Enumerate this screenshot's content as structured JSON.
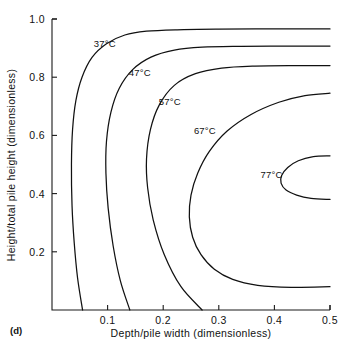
{
  "figure": {
    "panel_label": "(d)",
    "background_color": "#ffffff",
    "line_color": "#111111"
  },
  "chart_data": {
    "type": "line",
    "subtype": "contour",
    "title": "",
    "xlabel": "Depth/pile width (dimensionless)",
    "ylabel": "Height/total pile height (dimensionless)",
    "xlim": [
      0.0,
      0.5
    ],
    "ylim": [
      0.0,
      1.0
    ],
    "xticks": [
      0.1,
      0.2,
      0.3,
      0.4,
      0.5
    ],
    "yticks": [
      0.2,
      0.4,
      0.6,
      0.8,
      1.0
    ],
    "xticklabels": [
      "0.1",
      "0.2",
      "0.3",
      "0.4",
      "0.5"
    ],
    "yticklabels": [
      "0.2",
      "0.4",
      "0.6",
      "0.8",
      "1.0"
    ],
    "grid": false,
    "legend": "none",
    "contour_labels_inline": true,
    "levels": [
      {
        "label": "37°C",
        "value": 37,
        "unit": "°C",
        "label_position": [
          0.095,
          0.905
        ],
        "points": [
          [
            0.055,
            0.0
          ],
          [
            0.046,
            0.11
          ],
          [
            0.04,
            0.23
          ],
          [
            0.036,
            0.36
          ],
          [
            0.035,
            0.5
          ],
          [
            0.037,
            0.62
          ],
          [
            0.043,
            0.72
          ],
          [
            0.054,
            0.8
          ],
          [
            0.072,
            0.868
          ],
          [
            0.098,
            0.915
          ],
          [
            0.131,
            0.945
          ],
          [
            0.17,
            0.958
          ],
          [
            0.225,
            0.963
          ],
          [
            0.3,
            0.965
          ],
          [
            0.4,
            0.966
          ],
          [
            0.5,
            0.966
          ]
        ]
      },
      {
        "label": "47°C",
        "value": 47,
        "unit": "°C",
        "label_position": [
          0.158,
          0.805
        ],
        "points": [
          [
            0.14,
            0.0
          ],
          [
            0.123,
            0.1
          ],
          [
            0.11,
            0.22
          ],
          [
            0.101,
            0.35
          ],
          [
            0.097,
            0.47
          ],
          [
            0.098,
            0.58
          ],
          [
            0.106,
            0.68
          ],
          [
            0.121,
            0.762
          ],
          [
            0.145,
            0.826
          ],
          [
            0.178,
            0.869
          ],
          [
            0.22,
            0.893
          ],
          [
            0.27,
            0.903
          ],
          [
            0.34,
            0.906
          ],
          [
            0.42,
            0.907
          ],
          [
            0.5,
            0.907
          ]
        ]
      },
      {
        "label": "57°C",
        "value": 57,
        "unit": "°C",
        "label_position": [
          0.212,
          0.705
        ],
        "points": [
          [
            0.27,
            0.0
          ],
          [
            0.232,
            0.08
          ],
          [
            0.202,
            0.19
          ],
          [
            0.182,
            0.31
          ],
          [
            0.172,
            0.42
          ],
          [
            0.17,
            0.52
          ],
          [
            0.177,
            0.62
          ],
          [
            0.193,
            0.705
          ],
          [
            0.22,
            0.772
          ],
          [
            0.258,
            0.812
          ],
          [
            0.305,
            0.831
          ],
          [
            0.365,
            0.838
          ],
          [
            0.435,
            0.84
          ],
          [
            0.5,
            0.84
          ]
        ]
      },
      {
        "label": "67°C",
        "value": 67,
        "unit": "°C",
        "label_position": [
          0.275,
          0.605
        ],
        "points": [
          [
            0.5,
            0.08
          ],
          [
            0.43,
            0.078
          ],
          [
            0.37,
            0.085
          ],
          [
            0.325,
            0.105
          ],
          [
            0.292,
            0.14
          ],
          [
            0.268,
            0.19
          ],
          [
            0.253,
            0.25
          ],
          [
            0.247,
            0.32
          ],
          [
            0.25,
            0.395
          ],
          [
            0.262,
            0.47
          ],
          [
            0.283,
            0.545
          ],
          [
            0.315,
            0.615
          ],
          [
            0.358,
            0.672
          ],
          [
            0.408,
            0.714
          ],
          [
            0.455,
            0.737
          ],
          [
            0.5,
            0.745
          ]
        ]
      },
      {
        "label": "77°C",
        "value": 77,
        "unit": "°C",
        "label_position": [
          0.395,
          0.455
        ],
        "points": [
          [
            0.5,
            0.53
          ],
          [
            0.47,
            0.527
          ],
          [
            0.443,
            0.513
          ],
          [
            0.424,
            0.49
          ],
          [
            0.413,
            0.462
          ],
          [
            0.412,
            0.436
          ],
          [
            0.421,
            0.412
          ],
          [
            0.44,
            0.395
          ],
          [
            0.466,
            0.384
          ],
          [
            0.5,
            0.38
          ]
        ]
      }
    ]
  }
}
